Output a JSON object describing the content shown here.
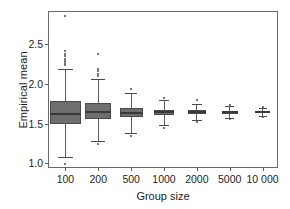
{
  "chart_data": {
    "type": "box",
    "title": "",
    "xlabel": "Group size",
    "ylabel": "Empirical mean",
    "categories": [
      "100",
      "200",
      "500",
      "1000",
      "2000",
      "5000",
      "10 000"
    ],
    "ylim": [
      0.93,
      2.9
    ],
    "yticks": [
      1.0,
      1.5,
      2.0,
      2.5
    ],
    "ytick_labels": [
      "1.0",
      "1.5",
      "2.0",
      "2.5"
    ],
    "grid": false,
    "legend": null,
    "box_fill": "#6e6e6e",
    "box_edge": "#4a4a4a",
    "median_color": "#3a3a3a",
    "whisker_color": "#5e5e5e",
    "frame_color": "#6a6a6a",
    "boxes": [
      {
        "category": "100",
        "width_frac": 0.92,
        "q1": 1.5,
        "median": 1.625,
        "q3": 1.78,
        "whisker_low": 1.085,
        "whisker_high": 2.185,
        "outliers": [
          2.855,
          2.405,
          2.375,
          2.345,
          2.315,
          2.285,
          2.255,
          2.235,
          0.995
        ]
      },
      {
        "category": "200",
        "width_frac": 0.8,
        "q1": 1.555,
        "median": 1.64,
        "q3": 1.755,
        "whisker_low": 1.28,
        "whisker_high": 2.055,
        "outliers": [
          2.375,
          2.185,
          2.155,
          2.125,
          2.095,
          1.245
        ]
      },
      {
        "category": "500",
        "width_frac": 0.7,
        "q1": 1.585,
        "median": 1.635,
        "q3": 1.695,
        "whisker_low": 1.385,
        "whisker_high": 1.885,
        "outliers": [
          1.935,
          1.345
        ]
      },
      {
        "category": "1000",
        "width_frac": 0.62,
        "q1": 1.605,
        "median": 1.64,
        "q3": 1.675,
        "whisker_low": 1.485,
        "whisker_high": 1.79,
        "outliers": [
          1.825,
          1.44
        ]
      },
      {
        "category": "2000",
        "width_frac": 0.56,
        "q1": 1.615,
        "median": 1.64,
        "q3": 1.665,
        "whisker_low": 1.545,
        "whisker_high": 1.75,
        "outliers": [
          1.79,
          1.515
        ]
      },
      {
        "category": "5000",
        "width_frac": 0.5,
        "q1": 1.625,
        "median": 1.642,
        "q3": 1.66,
        "whisker_low": 1.575,
        "whisker_high": 1.715,
        "outliers": [
          1.73,
          1.555
        ]
      },
      {
        "category": "10 000",
        "width_frac": 0.46,
        "q1": 1.63,
        "median": 1.643,
        "q3": 1.657,
        "whisker_low": 1.59,
        "whisker_high": 1.695,
        "outliers": [
          1.705,
          1.585
        ]
      }
    ]
  }
}
